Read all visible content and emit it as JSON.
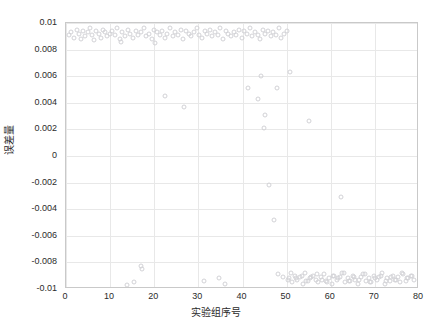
{
  "chart_data": {
    "type": "scatter",
    "title": "",
    "xlabel": "实验组序号",
    "ylabel": "误差量",
    "xlim": [
      0,
      80
    ],
    "ylim": [
      -0.01,
      0.01
    ],
    "xticks": [
      0,
      10,
      20,
      30,
      40,
      50,
      60,
      70,
      80
    ],
    "xtick_labels": [
      "0",
      "10",
      "20",
      "30",
      "40",
      "50",
      "60",
      "70",
      "80"
    ],
    "yticks": [
      0.01,
      0.008,
      0.006,
      0.004,
      0.002,
      0,
      -0.002,
      -0.004,
      -0.006,
      -0.008,
      -0.01
    ],
    "ytick_labels": [
      "0.01",
      "0.008",
      "0.006",
      "0.004",
      "0.002",
      "0",
      "-0.002",
      "-0.004",
      "-0.006",
      "-0.008",
      "-0.01"
    ],
    "grid": true,
    "legend": null,
    "marker": "open-circle",
    "marker_color": "#d2d2d6",
    "series": [
      {
        "name": "误差量",
        "x": [
          0.6,
          1.2,
          1.8,
          2.4,
          2.9,
          3.4,
          3.9,
          4.4,
          4.9,
          5.4,
          5.9,
          6.4,
          6.9,
          7.4,
          7.9,
          8.4,
          8.9,
          9.4,
          9.9,
          10.4,
          11.0,
          11.6,
          12.2,
          12.8,
          13.4,
          14.0,
          14.6,
          15.2,
          15.8,
          16.4,
          17.0,
          17.6,
          18.2,
          18.8,
          19.4,
          20.0,
          20.6,
          21.2,
          21.8,
          22.4,
          23.0,
          23.6,
          24.2,
          24.8,
          25.4,
          26.0,
          26.6,
          27.2,
          27.8,
          28.4,
          29.0,
          29.6,
          30.2,
          30.8,
          31.4,
          32.0,
          32.6,
          33.2,
          33.8,
          34.4,
          35.0,
          35.6,
          36.2,
          36.8,
          37.4,
          38.0,
          38.6,
          39.2,
          39.8,
          40.4,
          41.0,
          41.6,
          42.2,
          42.8,
          43.4,
          44.0,
          44.6,
          45.2,
          45.8,
          46.4,
          47.0,
          47.6,
          48.2,
          48.8,
          49.4,
          50.0,
          50.6,
          51.2,
          51.8,
          52.4,
          53.0,
          53.6,
          54.2,
          54.8,
          55.4,
          56.0,
          56.6,
          57.2,
          57.8,
          58.4,
          59.0,
          59.6,
          60.2,
          60.8,
          61.4,
          62.0,
          62.6,
          63.2,
          63.8,
          64.4,
          65.0,
          65.6,
          66.2,
          66.8,
          67.4,
          68.0,
          68.6,
          69.2,
          69.8,
          70.4,
          71.0,
          71.6,
          72.2,
          72.8,
          73.4,
          74.0,
          74.6,
          75.2,
          75.8,
          76.4,
          77.0,
          77.6,
          78.2,
          78.8,
          13.8,
          15.5,
          16.9,
          17.3,
          31.3,
          34.6,
          36.0,
          22.5,
          26.7,
          41.2,
          43.5,
          44.3,
          45.1,
          46.0,
          47.2,
          48.0,
          49.1,
          50.2,
          51.0,
          52.1,
          53.4,
          54.5,
          55.6,
          56.8,
          58.0,
          59.2,
          60.5,
          61.7,
          62.9,
          64.1,
          65.3,
          66.5,
          67.7,
          68.9,
          70.1,
          71.3,
          72.5,
          73.7,
          74.9,
          76.1,
          77.3,
          78.5,
          20.1,
          12.4,
          47.8,
          55.0,
          62.4,
          50.8,
          44.9
        ],
        "y": [
          0.0091,
          0.0093,
          0.0089,
          0.0095,
          0.0092,
          0.0088,
          0.0094,
          0.009,
          0.0093,
          0.0096,
          0.0091,
          0.0087,
          0.0094,
          0.0092,
          0.0089,
          0.0095,
          0.0093,
          0.009,
          0.0092,
          0.0094,
          0.0091,
          0.0096,
          0.0088,
          0.0093,
          0.009,
          0.0095,
          0.0092,
          0.0089,
          0.0094,
          0.0091,
          0.0093,
          0.0096,
          0.009,
          0.0092,
          0.0088,
          0.0095,
          0.0093,
          0.0091,
          0.0094,
          0.0089,
          0.0092,
          0.0096,
          0.009,
          0.0093,
          0.0091,
          0.0095,
          0.0088,
          0.0094,
          0.0092,
          0.009,
          0.0093,
          0.0096,
          0.0091,
          0.0089,
          0.0094,
          0.0092,
          0.0095,
          0.009,
          0.0093,
          0.0091,
          0.0096,
          0.0088,
          0.0094,
          0.0092,
          0.009,
          0.0093,
          0.0091,
          0.0095,
          0.0089,
          0.0094,
          0.0092,
          0.0096,
          0.009,
          0.0093,
          0.0091,
          0.0088,
          0.0095,
          0.0092,
          0.0094,
          0.009,
          0.0093,
          0.0091,
          0.0096,
          0.0089,
          0.0092,
          0.0094,
          -0.0092,
          -0.0095,
          -0.009,
          -0.0093,
          -0.0091,
          -0.0096,
          -0.0088,
          -0.0094,
          -0.0092,
          -0.009,
          -0.0093,
          -0.0095,
          -0.0091,
          -0.0089,
          -0.0094,
          -0.0092,
          -0.0096,
          -0.009,
          -0.0093,
          -0.0091,
          -0.0088,
          -0.0095,
          -0.0092,
          -0.0094,
          -0.009,
          -0.0093,
          -0.0096,
          -0.0091,
          -0.0089,
          -0.0094,
          -0.0092,
          -0.0095,
          -0.009,
          -0.0093,
          -0.0091,
          -0.0088,
          -0.0096,
          -0.0092,
          -0.0094,
          -0.009,
          -0.0093,
          -0.0091,
          -0.0095,
          -0.0089,
          -0.0094,
          -0.0092,
          -0.009,
          -0.0093,
          -0.0097,
          -0.0095,
          -0.0083,
          -0.0085,
          -0.0094,
          -0.0092,
          -0.0096,
          0.0045,
          0.0037,
          0.0051,
          0.0043,
          0.006,
          0.0031,
          -0.0022,
          -0.0048,
          -0.0089,
          -0.0091,
          -0.0093,
          -0.0088,
          -0.0092,
          -0.009,
          -0.0094,
          -0.0091,
          -0.0089,
          -0.0093,
          -0.0095,
          -0.009,
          -0.0092,
          -0.0088,
          -0.0094,
          -0.0091,
          -0.0093,
          -0.0089,
          -0.0095,
          -0.0092,
          -0.009,
          -0.0094,
          -0.0091,
          -0.0093,
          -0.0088,
          -0.0092,
          -0.009,
          0.0085,
          0.0086,
          0.0051,
          0.0026,
          -0.0031,
          0.0063,
          0.0021
        ]
      }
    ]
  },
  "caption": {
    "text": ""
  }
}
